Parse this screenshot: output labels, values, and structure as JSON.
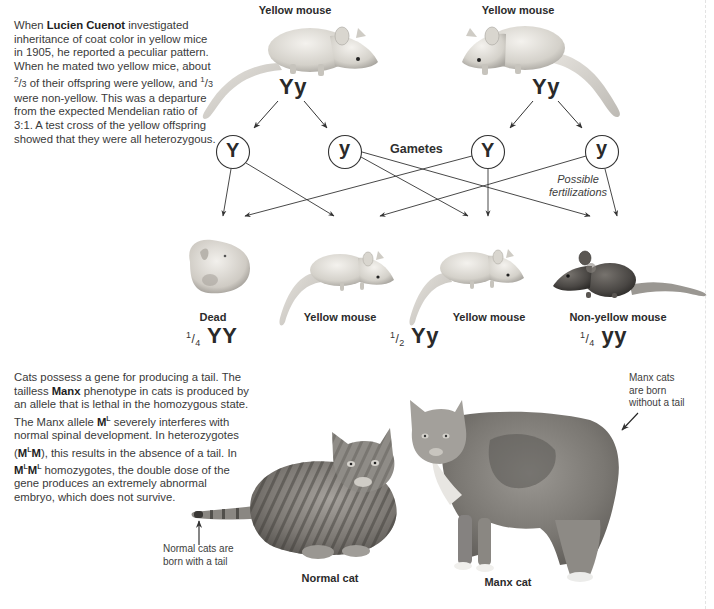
{
  "intro": {
    "pre": "When ",
    "name": "Lucien Cuenot",
    "text1": " investigated inheritance of coat color in yellow mice in 1905, he reported a peculiar pattern. When he mated two yellow mice, about ",
    "frac1_num": "2",
    "frac1_den": "3",
    "text2": " of their offspring were yellow, and ",
    "frac2_num": "1",
    "frac2_den": "3",
    "text3": " were non-yellow. This was a departure from the expected Mendelian ratio of 3:1. A test cross of the yellow offspring showed that they were all heterozygous."
  },
  "parents": [
    {
      "label": "Yellow mouse",
      "genotype": "Yy"
    },
    {
      "label": "Yellow mouse",
      "genotype": "Yy"
    }
  ],
  "gametes": {
    "label": "Gametes",
    "alleles": [
      "Y",
      "y",
      "Y",
      "y"
    ],
    "fertilization_label_1": "Possible",
    "fertilization_label_2": "fertilizations"
  },
  "offspring": [
    {
      "label": "Dead",
      "fraction_num": "1",
      "fraction_den": "4",
      "genotype": "YY"
    },
    {
      "label": "Yellow mouse"
    },
    {
      "label": "Yellow mouse",
      "fraction_num": "1",
      "fraction_den": "2",
      "genotype": "Yy"
    },
    {
      "label": "Non-yellow mouse",
      "fraction_num": "1",
      "fraction_den": "4",
      "genotype": "yy"
    }
  ],
  "manx": {
    "t1": "Cats possess a gene for producing a tail. The tailless ",
    "bold1": "Manx",
    "t2": " phenotype in cats is produced by an allele that is lethal in the homozygous state. The Manx allele ",
    "allele": "M",
    "allele_sup": "L",
    "t3": " severely interferes with normal spinal development. In heterozygotes (",
    "het_a": "M",
    "het_sup": "L",
    "het_b": "M",
    "t4": "), this results in the absence of a tail. In ",
    "hom_a": "M",
    "hom_sup1": "L",
    "hom_b": "M",
    "hom_sup2": "L",
    "t5": " homozygotes, the double dose of the gene produces an extremely abnormal embryo, which does not survive."
  },
  "cats": {
    "normal_caption_1": "Normal cats are",
    "normal_caption_2": "born with a tail",
    "normal_label": "Normal cat",
    "manx_caption_1": "Manx cats",
    "manx_caption_2": "are born",
    "manx_caption_3": "without a tail",
    "manx_label": "Manx cat"
  },
  "colors": {
    "text": "#2a2a2a",
    "line": "#333333",
    "yellow_mouse": "#d9d6cf",
    "non_yellow_mouse": "#4a4744",
    "cat_fur": "#8d8a86"
  }
}
